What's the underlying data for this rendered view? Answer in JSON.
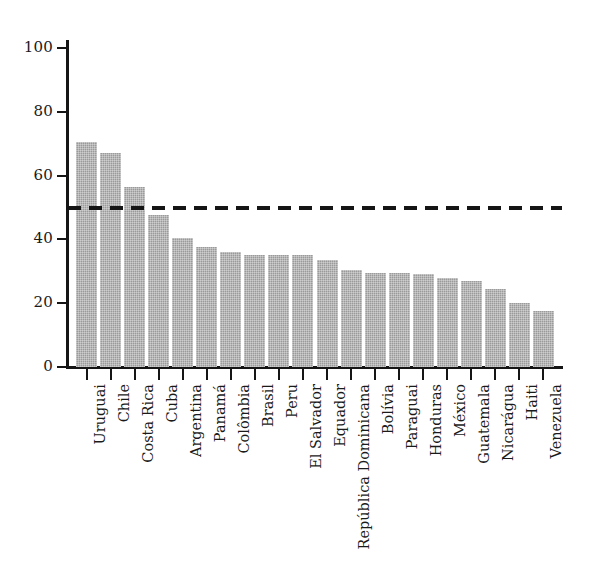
{
  "chart_data": {
    "type": "bar",
    "title": "",
    "subtitle": "",
    "xlabel": "",
    "ylabel": "",
    "ylim": [
      0,
      110
    ],
    "yticks": [
      0,
      20,
      40,
      60,
      80,
      100
    ],
    "ytick_labels": [
      "0",
      "20",
      "40",
      "60",
      "80",
      "100"
    ],
    "grid": false,
    "legend": null,
    "orientation": "vertical",
    "bar_color": "#9a9a9a",
    "axis_color": "#151515",
    "categories": [
      "Uruguai",
      "Chile",
      "Costa Rica",
      "Cuba",
      "Argentina",
      "Panamá",
      "Colômbia",
      "Brasil",
      "Peru",
      "El Salvador",
      "Equador",
      "República Dominicana",
      "Bolívia",
      "Paraguai",
      "Honduras",
      "México",
      "Guatemala",
      "Nicarágua",
      "Haiti",
      "Venezuela"
    ],
    "values": [
      70.5,
      67.0,
      56.5,
      47.5,
      40.5,
      37.5,
      36.0,
      35.0,
      35.0,
      35.0,
      33.5,
      30.5,
      29.5,
      29.5,
      29.0,
      28.0,
      27.0,
      24.5,
      20.0,
      17.5
    ],
    "annotations": [
      {
        "kind": "horizontal-reference-line",
        "value": 50,
        "style": "dashed",
        "color": "#151515",
        "label": ""
      }
    ]
  }
}
